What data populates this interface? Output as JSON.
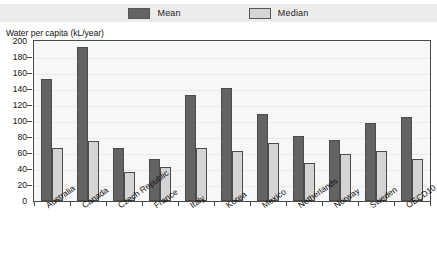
{
  "legend": {
    "position": "top-center",
    "entries": [
      {
        "label": "Mean",
        "color": "#636363",
        "icon": "legend-swatch-mean"
      },
      {
        "label": "Median",
        "color": "#d4d4d4",
        "icon": "legend-swatch-median"
      }
    ]
  },
  "chart_data": {
    "type": "bar",
    "title": "",
    "subtitle": "",
    "xlabel": "",
    "ylabel": "Water per capita (kL/year)",
    "ylim": [
      0,
      200
    ],
    "ytick_step": 20,
    "yticks": [
      200,
      180,
      160,
      140,
      120,
      100,
      80,
      60,
      40,
      20,
      0
    ],
    "grid": true,
    "legend_position": "top-center",
    "categories": [
      "Australia",
      "Canada",
      "Czech Republic",
      "France",
      "Italy",
      "Korea",
      "Mexico",
      "Netherlands",
      "Norway",
      "Sweden",
      "OECD10"
    ],
    "series": [
      {
        "name": "Mean",
        "color": "#636363",
        "values": [
          153,
          193,
          66,
          52,
          133,
          141,
          109,
          81,
          76,
          98,
          105
        ]
      },
      {
        "name": "Median",
        "color": "#d4d4d4",
        "values": [
          66,
          75,
          36,
          42,
          66,
          63,
          72,
          48,
          59,
          62,
          53
        ]
      }
    ]
  }
}
